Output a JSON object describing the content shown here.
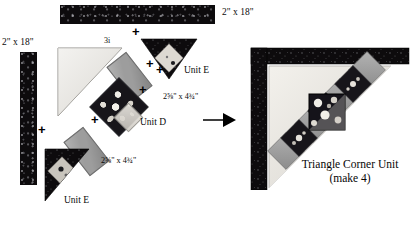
{
  "diagram": {
    "colors": {
      "dark_print": "#0d0b0d",
      "medium_gray": "#9d9d9d",
      "light_cream": "#e8e6e1",
      "floral_dark": "#17151a",
      "ink": "#000000",
      "background": "#ffffff"
    }
  },
  "labels": {
    "strip_top_dim": "2\" x 18\"",
    "strip_left_dim": "2\" x 18\"",
    "triangle_label": "3i",
    "rect_upper_dim": "2⅝\" x 4¾\"",
    "rect_lower_dim": "2⅝\" x 4¾\"",
    "unit_e_top": "Unit E",
    "unit_e_bottom": "Unit E",
    "unit_d": "Unit D"
  },
  "plus_signs": [
    {
      "id": "plus-top-strip",
      "symbol": "+"
    },
    {
      "id": "plus-unit-e-top",
      "symbol": "+"
    },
    {
      "id": "plus-rect-upper",
      "symbol": "+"
    },
    {
      "id": "plus-unit-d-left",
      "symbol": "+"
    },
    {
      "id": "plus-unit-d-right",
      "symbol": "+"
    },
    {
      "id": "plus-left-strip",
      "symbol": "+"
    },
    {
      "id": "plus-unit-e-bottom",
      "symbol": "+"
    }
  ],
  "arrow": {
    "direction": "right",
    "name": "equals-arrow"
  },
  "result": {
    "caption_line1": "Triangle Corner Unit",
    "caption_line2": "(make 4)"
  }
}
